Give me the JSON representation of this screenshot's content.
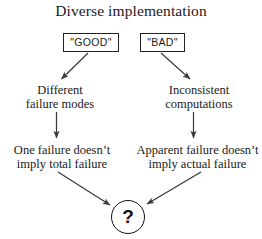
{
  "diagram": {
    "title": "Diverse implementation",
    "background_color": "#ffffff",
    "ink_color": "#1a1a1a",
    "arrow_color": "#3a3a3a",
    "sources": [
      {
        "id": "good",
        "label": "\"GOOD\""
      },
      {
        "id": "bad",
        "label": "\"BAD\""
      }
    ],
    "mid_level": [
      {
        "id": "different-failure-modes",
        "line1": "Different",
        "line2": "failure modes"
      },
      {
        "id": "inconsistent-computations",
        "line1": "Inconsistent",
        "line2": "computations"
      }
    ],
    "low_level": [
      {
        "id": "one-failure",
        "line1": "One failure doesn’t",
        "line2": "imply total failure"
      },
      {
        "id": "apparent-failure",
        "line1": "Apparent failure doesn’t",
        "line2": "imply actual failure"
      }
    ],
    "terminal": {
      "id": "question",
      "label": "?",
      "shape": "circle"
    },
    "connectors": [
      {
        "id": "good-to-different",
        "from": "good",
        "to": "different-failure-modes",
        "style": "diagonal-left"
      },
      {
        "id": "bad-to-inconsistent",
        "from": "bad",
        "to": "inconsistent-computations",
        "style": "diagonal-right"
      },
      {
        "id": "different-to-onefail",
        "from": "different-failure-modes",
        "to": "one-failure",
        "style": "vertical"
      },
      {
        "id": "inconsistent-to-apparent",
        "from": "inconsistent-computations",
        "to": "apparent-failure",
        "style": "vertical"
      },
      {
        "id": "onefail-to-question",
        "from": "one-failure",
        "to": "question",
        "style": "converge-right-down"
      },
      {
        "id": "apparent-to-question",
        "from": "apparent-failure",
        "to": "question",
        "style": "converge-left-down"
      }
    ]
  }
}
